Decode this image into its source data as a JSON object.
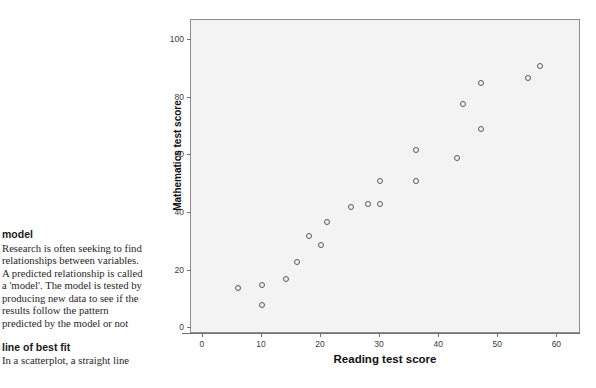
{
  "glossary": {
    "entries": [
      {
        "term": "model",
        "body": "Research is often seeking to find relationships between variables. A predicted relationship is called a 'model'. The model is tested by producing new data to see if the results follow the pattern predicted by the model or not"
      },
      {
        "term": "line of best fit",
        "body": "In a scatterplot, a straight line"
      }
    ]
  },
  "chart_data": {
    "type": "scatter",
    "title": "",
    "xlabel": "Reading test score",
    "ylabel": "Mathematics test score",
    "xlim": [
      -2,
      64
    ],
    "ylim": [
      -2,
      107
    ],
    "xticks": [
      0,
      10,
      20,
      30,
      40,
      50,
      60
    ],
    "yticks": [
      0,
      20,
      40,
      60,
      80,
      100
    ],
    "xtick_labels": [
      "0",
      "10",
      "20",
      "30",
      "40",
      "50",
      "60"
    ],
    "ytick_labels": [
      "0",
      "20",
      "40",
      "60",
      "80",
      "100"
    ],
    "grid": false,
    "legend": null,
    "marker": "open-circle",
    "marker_color": "#58595b",
    "plot_background": "#f3f3f3",
    "points": [
      {
        "x": 6,
        "y": 14
      },
      {
        "x": 10,
        "y": 15
      },
      {
        "x": 10,
        "y": 8
      },
      {
        "x": 14,
        "y": 17
      },
      {
        "x": 16,
        "y": 23
      },
      {
        "x": 18,
        "y": 32
      },
      {
        "x": 20,
        "y": 29
      },
      {
        "x": 21,
        "y": 37
      },
      {
        "x": 25,
        "y": 42
      },
      {
        "x": 28,
        "y": 43
      },
      {
        "x": 30,
        "y": 51
      },
      {
        "x": 30,
        "y": 43
      },
      {
        "x": 36,
        "y": 62
      },
      {
        "x": 36,
        "y": 51
      },
      {
        "x": 43,
        "y": 59
      },
      {
        "x": 44,
        "y": 78
      },
      {
        "x": 47,
        "y": 85
      },
      {
        "x": 47,
        "y": 69
      },
      {
        "x": 55,
        "y": 87
      },
      {
        "x": 57,
        "y": 91
      }
    ]
  }
}
